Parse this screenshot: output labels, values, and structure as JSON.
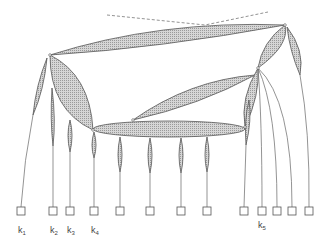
{
  "diagram": {
    "type": "tree",
    "colors": {
      "edge_fill": "#c8c8c8",
      "edge_stroke": "#555555",
      "line": "#666666",
      "dashed": "#777777",
      "box_stroke": "#555555",
      "label": "#444444"
    },
    "labels": [
      {
        "id": "k1",
        "base": "k",
        "sub": "1",
        "x": 19,
        "y": 233
      },
      {
        "id": "k2",
        "base": "k",
        "sub": "2",
        "x": 52,
        "y": 233
      },
      {
        "id": "k3",
        "base": "k",
        "sub": "3",
        "x": 68,
        "y": 233
      },
      {
        "id": "k4",
        "base": "k",
        "sub": "4",
        "x": 92,
        "y": 233
      },
      {
        "id": "k5",
        "base": "k",
        "sub": "5",
        "x": 259,
        "y": 226
      }
    ],
    "leaves": [
      {
        "x": 21
      },
      {
        "x": 53
      },
      {
        "x": 70
      },
      {
        "x": 94
      },
      {
        "x": 120
      },
      {
        "x": 150
      },
      {
        "x": 181
      },
      {
        "x": 207
      },
      {
        "x": 244
      },
      {
        "x": 262
      },
      {
        "x": 277
      },
      {
        "x": 292
      },
      {
        "x": 309
      }
    ],
    "leaf_y": 211
  }
}
